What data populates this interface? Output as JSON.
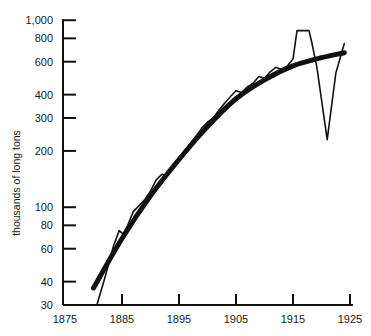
{
  "chart_data": {
    "type": "line",
    "title": "",
    "xlabel": "",
    "ylabel": "thousands of long tons",
    "yscale": "log",
    "xlim": [
      1875,
      1925
    ],
    "ylim": [
      30,
      1000
    ],
    "grid": false,
    "legend": null,
    "x_ticks": [
      1875,
      1885,
      1895,
      1905,
      1915,
      1925
    ],
    "x_tick_labels": [
      "1875",
      "1885",
      "1895",
      "1905",
      "1915",
      "1925"
    ],
    "y_ticks": [
      30,
      40,
      60,
      80,
      100,
      200,
      300,
      400,
      600,
      800,
      1000
    ],
    "y_tick_labels": [
      "30",
      "40",
      "60",
      "80",
      "100",
      "200",
      "300",
      "400",
      "600",
      "800",
      "1,000"
    ],
    "series": [
      {
        "name": "actual",
        "style": "thin",
        "x": [
          1880.6,
          1882,
          1883.5,
          1884.5,
          1885.2,
          1886,
          1887,
          1888,
          1889,
          1890,
          1891,
          1892,
          1893,
          1894,
          1895,
          1896,
          1897,
          1898,
          1899,
          1900,
          1901,
          1902,
          1903,
          1904,
          1905,
          1906,
          1907,
          1908,
          1909,
          1910,
          1911,
          1912,
          1913,
          1914,
          1915,
          1915.7,
          1917.8,
          1918.3,
          1919.2,
          1921.0,
          1922.5,
          1924.0
        ],
        "values": [
          30,
          42,
          62,
          75,
          72,
          80,
          95,
          102,
          110,
          122,
          140,
          150,
          148,
          165,
          180,
          200,
          220,
          240,
          265,
          285,
          300,
          330,
          360,
          390,
          420,
          410,
          440,
          460,
          500,
          490,
          530,
          560,
          545,
          570,
          620,
          880,
          880,
          760,
          560,
          230,
          520,
          750
        ]
      },
      {
        "name": "trend",
        "style": "thick",
        "x": [
          1880,
          1885,
          1890,
          1895,
          1900,
          1905,
          1910,
          1915,
          1920,
          1924
        ],
        "values": [
          37,
          68,
          115,
          180,
          270,
          380,
          480,
          570,
          630,
          670
        ]
      }
    ]
  },
  "axes": {
    "y_title": "thousands of long tons"
  }
}
